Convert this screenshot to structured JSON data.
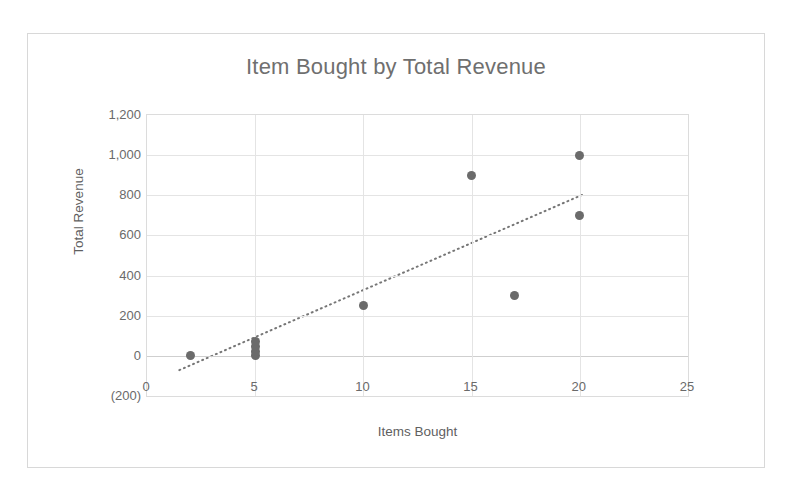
{
  "chart_data": {
    "type": "scatter",
    "title": "Item Bought by Total Revenue",
    "xlabel": "Items Bought",
    "ylabel": "Total Revenue",
    "xlim": [
      0,
      25
    ],
    "ylim": [
      -200,
      1200
    ],
    "grid": true,
    "legend": false,
    "x_ticks": [
      "0",
      "5",
      "10",
      "15",
      "20",
      "25"
    ],
    "x_tick_values": [
      0,
      5,
      10,
      15,
      20,
      25
    ],
    "y_ticks": [
      "(200)",
      "0",
      "200",
      "400",
      "600",
      "800",
      "1,000",
      "1,200"
    ],
    "y_tick_values": [
      -200,
      0,
      200,
      400,
      600,
      800,
      1000,
      1200
    ],
    "series": [
      {
        "name": "Items Bought vs Total Revenue",
        "marker_color": "#6b6b6b",
        "points": [
          {
            "x": 2,
            "y": 0
          },
          {
            "x": 5,
            "y": 0
          },
          {
            "x": 5,
            "y": 20
          },
          {
            "x": 5,
            "y": 45
          },
          {
            "x": 5,
            "y": 70
          },
          {
            "x": 10,
            "y": 250
          },
          {
            "x": 15,
            "y": 900
          },
          {
            "x": 17,
            "y": 300
          },
          {
            "x": 20,
            "y": 700
          },
          {
            "x": 20,
            "y": 1000
          }
        ]
      }
    ],
    "trendline": {
      "style": "dotted",
      "color": "#767676",
      "x_start": 1.5,
      "y_start": -80,
      "x_end": 20.2,
      "y_end": 800
    },
    "colors": {
      "marker": "#6b6b6b",
      "trendline": "#767676",
      "grid": "#e4e4e4",
      "axis_text": "#6a6a6a",
      "title_text": "#6f6f6f",
      "plot_background": "#ffffff",
      "frame_border": "#d8d8d8"
    }
  }
}
